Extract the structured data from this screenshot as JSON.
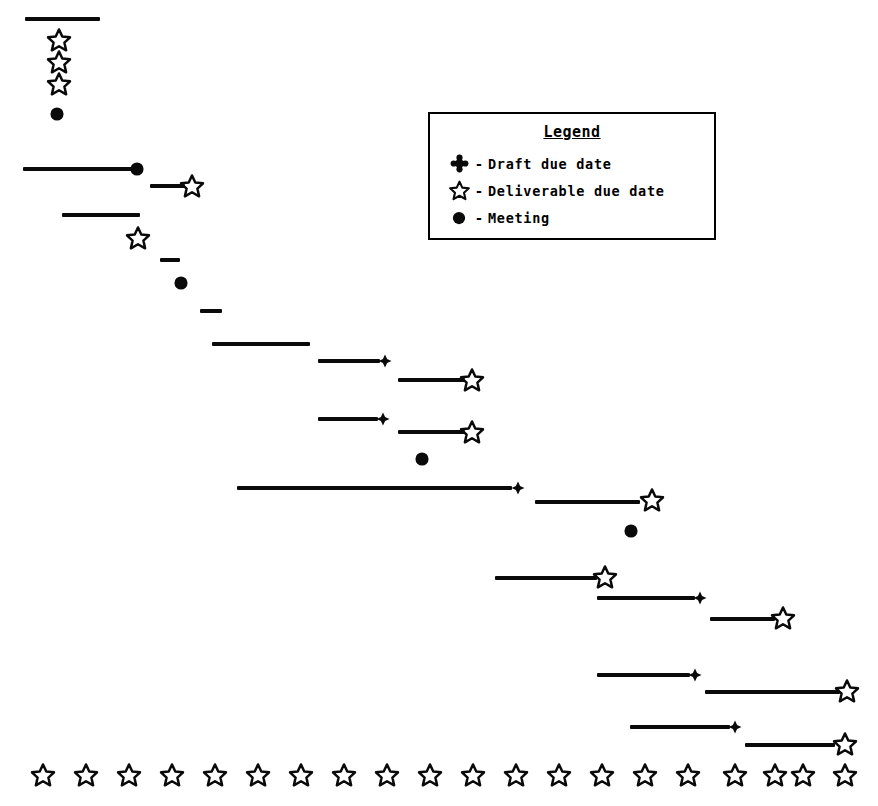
{
  "chart_data": {
    "type": "bar",
    "xlabel": "",
    "ylabel": "",
    "orientation": "horizontal-timeline",
    "grid": false,
    "xlim": [
      0,
      878
    ],
    "ylim": [
      0,
      806
    ],
    "legend": {
      "position": "top-right",
      "title": "Legend",
      "separator": "-",
      "entries": [
        {
          "symbol": "draft-marker",
          "glyph": "plus-club",
          "label": "Draft due date"
        },
        {
          "symbol": "deliverable-marker",
          "glyph": "star-outline",
          "label": "Deliverable due date"
        },
        {
          "symbol": "meeting-marker",
          "glyph": "filled-circle",
          "label": "Meeting"
        }
      ]
    },
    "bars": [
      {
        "id": 1,
        "x1": 25,
        "x2": 100,
        "y": 19,
        "length": 75
      },
      {
        "id": 2,
        "x1": 23,
        "x2": 133,
        "y": 169,
        "length": 110
      },
      {
        "id": 3,
        "x1": 150,
        "x2": 185,
        "y": 186,
        "length": 35
      },
      {
        "id": 4,
        "x1": 62,
        "x2": 140,
        "y": 215,
        "length": 78
      },
      {
        "id": 5,
        "x1": 160,
        "x2": 180,
        "y": 260,
        "length": 20
      },
      {
        "id": 6,
        "x1": 200,
        "x2": 222,
        "y": 311,
        "length": 22
      },
      {
        "id": 7,
        "x1": 212,
        "x2": 310,
        "y": 344,
        "length": 98
      },
      {
        "id": 8,
        "x1": 318,
        "x2": 380,
        "y": 361,
        "length": 62
      },
      {
        "id": 9,
        "x1": 398,
        "x2": 465,
        "y": 380,
        "length": 67
      },
      {
        "id": 10,
        "x1": 318,
        "x2": 378,
        "y": 419,
        "length": 60
      },
      {
        "id": 11,
        "x1": 398,
        "x2": 465,
        "y": 432,
        "length": 67
      },
      {
        "id": 12,
        "x1": 237,
        "x2": 512,
        "y": 488,
        "length": 275
      },
      {
        "id": 13,
        "x1": 535,
        "x2": 640,
        "y": 502,
        "length": 105
      },
      {
        "id": 14,
        "x1": 495,
        "x2": 597,
        "y": 578,
        "length": 102
      },
      {
        "id": 15,
        "x1": 597,
        "x2": 695,
        "y": 598,
        "length": 98
      },
      {
        "id": 16,
        "x1": 710,
        "x2": 775,
        "y": 619,
        "length": 65
      },
      {
        "id": 17,
        "x1": 597,
        "x2": 690,
        "y": 675,
        "length": 93
      },
      {
        "id": 18,
        "x1": 705,
        "x2": 840,
        "y": 692,
        "length": 135
      },
      {
        "id": 19,
        "x1": 630,
        "x2": 730,
        "y": 727,
        "length": 100
      },
      {
        "id": 20,
        "x1": 745,
        "x2": 835,
        "y": 745,
        "length": 90
      }
    ],
    "markers": [
      {
        "type": "deliverable",
        "x": 59,
        "y": 40
      },
      {
        "type": "deliverable",
        "x": 59,
        "y": 62
      },
      {
        "type": "deliverable",
        "x": 59,
        "y": 84
      },
      {
        "type": "meeting",
        "x": 57,
        "y": 114
      },
      {
        "type": "meeting",
        "x": 137,
        "y": 169
      },
      {
        "type": "deliverable",
        "x": 192,
        "y": 186
      },
      {
        "type": "deliverable",
        "x": 138,
        "y": 238
      },
      {
        "type": "meeting",
        "x": 181,
        "y": 283
      },
      {
        "type": "draft",
        "x": 385,
        "y": 361
      },
      {
        "type": "deliverable",
        "x": 472,
        "y": 380
      },
      {
        "type": "draft",
        "x": 383,
        "y": 419
      },
      {
        "type": "deliverable",
        "x": 472,
        "y": 432
      },
      {
        "type": "meeting",
        "x": 422,
        "y": 459
      },
      {
        "type": "draft",
        "x": 518,
        "y": 488
      },
      {
        "type": "deliverable",
        "x": 652,
        "y": 500
      },
      {
        "type": "meeting",
        "x": 631,
        "y": 531
      },
      {
        "type": "deliverable",
        "x": 605,
        "y": 577
      },
      {
        "type": "draft",
        "x": 700,
        "y": 598
      },
      {
        "type": "deliverable",
        "x": 783,
        "y": 618
      },
      {
        "type": "draft",
        "x": 695,
        "y": 675
      },
      {
        "type": "deliverable",
        "x": 847,
        "y": 691
      },
      {
        "type": "draft",
        "x": 735,
        "y": 727
      },
      {
        "type": "deliverable",
        "x": 845,
        "y": 744
      }
    ],
    "axis_markers": {
      "type": "deliverable",
      "y": 775,
      "count": 20,
      "x": [
        43,
        86,
        129,
        172,
        215,
        258,
        301,
        344,
        387,
        430,
        473,
        516,
        559,
        602,
        645,
        688,
        735,
        775,
        803,
        845
      ]
    },
    "colors": {
      "ink": "#0a0a0a",
      "background": "#ffffff"
    }
  }
}
